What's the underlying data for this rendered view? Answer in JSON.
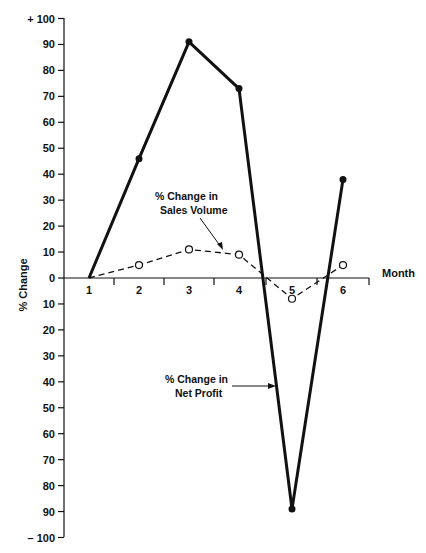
{
  "chart_data": {
    "type": "line",
    "title": "",
    "xlabel": "Month",
    "ylabel": "% Change",
    "x": [
      1,
      2,
      3,
      4,
      5,
      6
    ],
    "ylim": [
      -100,
      100
    ],
    "y_ticks": [
      100,
      90,
      80,
      70,
      60,
      50,
      40,
      30,
      20,
      10,
      0,
      -10,
      -20,
      -30,
      -40,
      -50,
      -60,
      -70,
      -80,
      -90,
      -100
    ],
    "y_tick_labels": [
      "+ 100",
      "90",
      "80",
      "70",
      "60",
      "50",
      "40",
      "30",
      "20",
      "10",
      "0",
      "10",
      "20",
      "30",
      "40",
      "50",
      "60",
      "70",
      "80",
      "90",
      "– 100"
    ],
    "x_tick_labels": [
      "1",
      "2",
      "3",
      "4",
      "5",
      "6"
    ],
    "grid": false,
    "legend": "none (inline annotations with arrows)",
    "series": [
      {
        "name": "% Change in Net Profit",
        "style": "solid thick line, filled dot markers",
        "values": [
          0,
          46,
          91,
          73,
          -89,
          38
        ]
      },
      {
        "name": "% Change in Sales Volume",
        "style": "dashed line, open circle markers",
        "values": [
          0,
          5,
          11,
          9,
          -8,
          5
        ]
      }
    ],
    "annotations": [
      {
        "text_lines": [
          "% Change in",
          "Sales Volume"
        ],
        "points_to": "Sales Volume line between months 3 and 4"
      },
      {
        "text_lines": [
          "% Change in",
          "Net Profit"
        ],
        "points_to": "Net Profit line between months 4 and 5"
      }
    ]
  },
  "labels": {
    "ylabel": "% Change",
    "xlabel": "Month",
    "annot_sales_1": "% Change in",
    "annot_sales_2": "Sales Volume",
    "annot_profit_1": "% Change in",
    "annot_profit_2": "Net Profit"
  },
  "colors": {
    "ink": "#111111",
    "background": "#ffffff"
  }
}
